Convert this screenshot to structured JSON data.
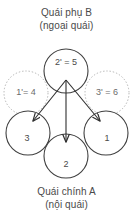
{
  "diagram": {
    "title_top": {
      "line1": "Quái phụ B",
      "line2": "(ngoại quái)"
    },
    "title_bottom": {
      "line1": "Quái chính A",
      "line2": "(nội quái)"
    },
    "colors": {
      "solid_stroke": "#3f3f3f",
      "dotted_stroke": "#b3b3b3",
      "text": "#4a4a4a",
      "background": "#ffffff",
      "arrow": "#2e2e2e"
    },
    "nodes": [
      {
        "id": "top-center",
        "label": "2' = 5",
        "style": "solid",
        "cx": 66,
        "cy": 71,
        "r": 22
      },
      {
        "id": "mid-left",
        "label": "1'= 4",
        "style": "dotted",
        "cx": 26,
        "cy": 93,
        "r": 22
      },
      {
        "id": "mid-right",
        "label": "3' = 6",
        "style": "dotted",
        "cx": 107,
        "cy": 93,
        "r": 22
      },
      {
        "id": "bottom-left",
        "label": "3",
        "style": "solid",
        "cx": 28,
        "cy": 133,
        "r": 22
      },
      {
        "id": "bottom-center",
        "label": "2",
        "style": "solid",
        "cx": 66,
        "cy": 156,
        "r": 22
      },
      {
        "id": "bottom-right",
        "label": "1",
        "style": "solid",
        "cx": 106,
        "cy": 133,
        "r": 22
      }
    ],
    "arrows": [
      {
        "id": "arrow-to-3",
        "from": "top-center",
        "to": "bottom-left",
        "x1": 66,
        "y1": 80,
        "x2": 32,
        "y2": 122
      },
      {
        "id": "arrow-to-2",
        "from": "top-center",
        "to": "bottom-center",
        "x1": 66,
        "y1": 80,
        "x2": 66,
        "y2": 143
      },
      {
        "id": "arrow-to-1",
        "from": "top-center",
        "to": "bottom-right",
        "x1": 66,
        "y1": 80,
        "x2": 101,
        "y2": 122
      }
    ]
  }
}
